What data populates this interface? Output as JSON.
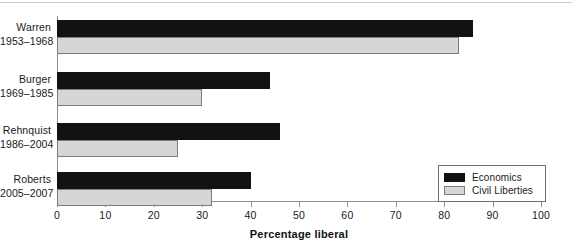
{
  "chart_data": {
    "type": "bar",
    "orientation": "horizontal",
    "title": "",
    "xlabel": "Percentage liberal",
    "ylabel": "",
    "xlim": [
      0,
      100
    ],
    "xticks": [
      0,
      10,
      20,
      30,
      40,
      50,
      60,
      70,
      80,
      90,
      100
    ],
    "grid": false,
    "legend_position": "bottom-right",
    "categories": [
      "Warren 1953–1968",
      "Burger 1969–1985",
      "Rehnquist 1986–2004",
      "Roberts 2005–2007"
    ],
    "series": [
      {
        "name": "Economics",
        "color": "#121212",
        "values": [
          86,
          44,
          46,
          40
        ]
      },
      {
        "name": "Civil Liberties",
        "color": "#d6d6d6",
        "values": [
          83,
          30,
          25,
          32
        ]
      }
    ]
  },
  "groups": [
    {
      "name": "Warren",
      "years": "1953–1968",
      "economics": 86,
      "civil": 83
    },
    {
      "name": "Burger",
      "years": "1969–1985",
      "economics": 44,
      "civil": 30
    },
    {
      "name": "Rehnquist",
      "years": "1986–2004",
      "economics": 46,
      "civil": 25
    },
    {
      "name": "Roberts",
      "years": "2005–2007",
      "economics": 40,
      "civil": 32
    }
  ],
  "axis": {
    "x_title": "Percentage liberal",
    "ticks": [
      "0",
      "10",
      "20",
      "30",
      "40",
      "50",
      "60",
      "70",
      "80",
      "90",
      "100"
    ]
  },
  "legend": {
    "items": [
      {
        "label": "Economics",
        "swatch": "economics"
      },
      {
        "label": "Civil Liberties",
        "swatch": "civil"
      }
    ]
  },
  "colors": {
    "economics": "#121212",
    "civil_liberties": "#d6d6d6",
    "axis": "#8d8d8f",
    "text": "#1a1a1a"
  }
}
